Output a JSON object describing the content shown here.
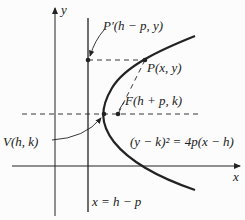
{
  "diagram": {
    "axes": {
      "x_label": "x",
      "y_label": "y"
    },
    "labels": {
      "p_prime": "P′(h − p, y)",
      "p": "P(x, y)",
      "focus": "F(h + p, k)",
      "vertex": "V(h, k)",
      "equation": "(y − k)² = 4p(x − h)",
      "directrix": "x = h − p"
    },
    "colors": {
      "ink": "#222222",
      "background": "#fcfcfc"
    }
  }
}
